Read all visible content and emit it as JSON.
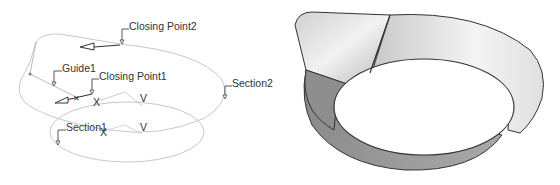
{
  "left_diagram": {
    "labels": {
      "closing_point2": "Closing Point2",
      "guide1": "Guide1",
      "closing_point1": "Closing Point1",
      "section2": "Section2",
      "section1": "Section1",
      "axis_x1": "X",
      "axis_y1": "V",
      "axis_x2": "X",
      "axis_y2": "V"
    },
    "colors": {
      "curve": "#c8c8c8",
      "label_text": "#333333",
      "leader": "#444444"
    }
  },
  "right_diagram": {
    "description": "Shaded swept surface (bowl with flared flap)",
    "colors": {
      "outline": "#333333",
      "light_face": "#e6e6e6",
      "mid_face": "#c4c4c4",
      "dark_face": "#8e8e8e",
      "inner_opening": "#ffffff"
    }
  }
}
